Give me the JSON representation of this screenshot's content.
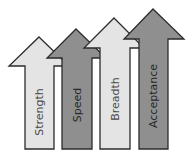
{
  "diagram": {
    "type": "rising-arrows",
    "colors": {
      "light": "#e4e4e4",
      "dark": "#8f8f8f",
      "outline": "#2b2b2b",
      "text_on_light": "#4a4a4a",
      "text_on_dark": "#262626"
    },
    "arrows": [
      {
        "label": "Strength",
        "shade": "light"
      },
      {
        "label": "Speed",
        "shade": "dark"
      },
      {
        "label": "Breadth",
        "shade": "light"
      },
      {
        "label": "Acceptance",
        "shade": "dark"
      }
    ]
  }
}
